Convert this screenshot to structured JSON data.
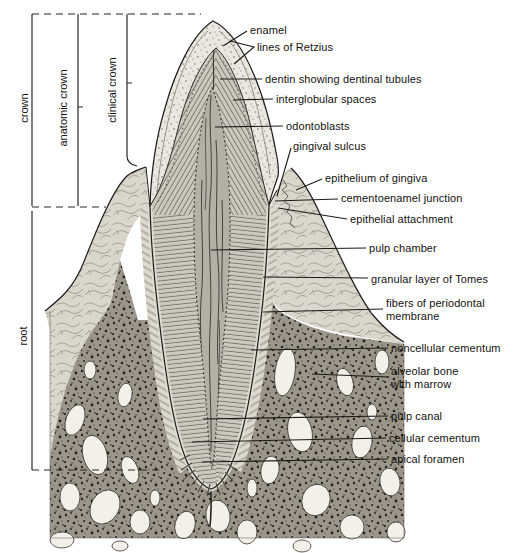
{
  "figure": {
    "kind": "anatomical line illustration"
  },
  "side_labels": {
    "crown": "crown",
    "anatomic_crown": "anatomic crown",
    "clinical_crown": "clinical crown",
    "root": "root"
  },
  "part_labels": [
    "enamel",
    "lines of Retzius",
    "dentin showing dentinal tubules",
    "interglobular spaces",
    "odontoblasts",
    "gingival sulcus",
    "epithelium of gingiva",
    "cementoenamel junction",
    "epithelial attachment",
    "pulp chamber",
    "granular layer of Tomes",
    "fibers of periodontal membrane",
    "noncellular cementum",
    "alveolar bone with marrow",
    "pulp canal",
    "cellular cementum",
    "apical foramen"
  ],
  "colors": {
    "ink": "#1c1a17",
    "paper": "#ffffff",
    "enamel": "#eae7e0",
    "dentin": "#cdc9bf",
    "pulp": "#b5b0a6",
    "gingiva": "#dad6cc",
    "bone": "#9c968a",
    "marrow": "#f3f0e9",
    "periodontal": "#ddd8ce"
  }
}
